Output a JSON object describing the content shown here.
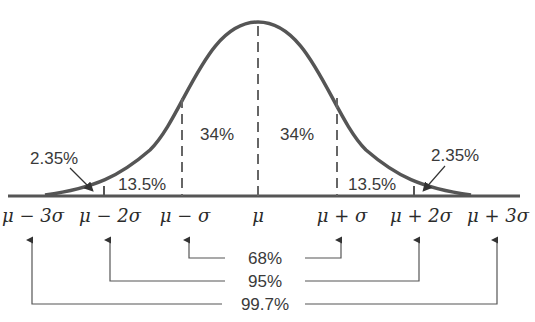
{
  "diagram": {
    "colors": {
      "curve": "#555555",
      "line": "#444444",
      "text": "#333333",
      "background": "#ffffff"
    },
    "regions": [
      {
        "id": "left-tail",
        "label": "2.35%"
      },
      {
        "id": "left-2sigma",
        "label": "13.5%"
      },
      {
        "id": "left-1sigma",
        "label": "34%"
      },
      {
        "id": "right-1sigma",
        "label": "34%"
      },
      {
        "id": "right-2sigma",
        "label": "13.5%"
      },
      {
        "id": "right-tail",
        "label": "2.35%"
      }
    ],
    "axis_labels": [
      "μ − 3σ",
      "μ − 2σ",
      "μ − σ",
      "μ",
      "μ + σ",
      "μ + 2σ",
      "μ + 3σ"
    ],
    "intervals": [
      {
        "range": "μ ± σ",
        "label": "68%"
      },
      {
        "range": "μ ± 2σ",
        "label": "95%"
      },
      {
        "range": "μ ± 3σ",
        "label": "99.7%"
      }
    ]
  }
}
